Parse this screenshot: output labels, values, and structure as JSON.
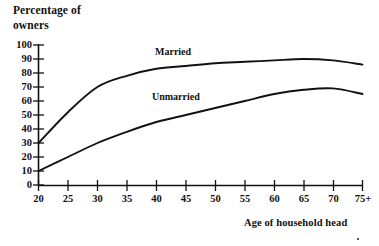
{
  "chart_data": {
    "type": "line",
    "title": "",
    "ylabel": "Percentage of\nowners",
    "xlabel": "Age of household head",
    "categories": [
      "20",
      "25",
      "30",
      "35",
      "40",
      "45",
      "50",
      "55",
      "60",
      "65",
      "70",
      "75+"
    ],
    "x": [
      20,
      25,
      30,
      35,
      40,
      45,
      50,
      55,
      60,
      65,
      70,
      75
    ],
    "ylim": [
      0,
      100
    ],
    "yticks": [
      0,
      10,
      20,
      30,
      40,
      50,
      60,
      70,
      80,
      90,
      100
    ],
    "ytick_labels": [
      "0",
      "10",
      "20",
      "30",
      "40",
      "50",
      "60",
      "70",
      "80",
      "90",
      "100"
    ],
    "grid": false,
    "legend_position": "inline-annotation",
    "series": [
      {
        "name": "Married",
        "label": "Married",
        "color": "#111111",
        "values": [
          30,
          52,
          70,
          78,
          83,
          85,
          87,
          88,
          89,
          90,
          89,
          86
        ]
      },
      {
        "name": "Unmarried",
        "label": "Unmarried",
        "color": "#111111",
        "values": [
          10,
          20,
          30,
          38,
          45,
          50,
          55,
          60,
          65,
          68,
          69,
          65
        ]
      }
    ],
    "annotations": [
      {
        "text": "Married",
        "x": 37,
        "y": 96
      },
      {
        "text": "Unmarried",
        "x": 37,
        "y": 63
      }
    ]
  },
  "axes": {
    "y_title": "Percentage of\nowners",
    "x_title": "Age of household head"
  }
}
